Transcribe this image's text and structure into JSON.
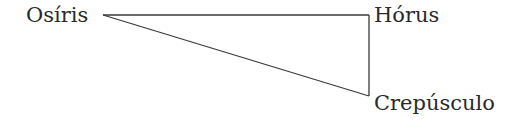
{
  "diagram": {
    "nodes": [
      {
        "id": "osiris",
        "label": "Osíris"
      },
      {
        "id": "horus",
        "label": "Hórus"
      },
      {
        "id": "crepusculo",
        "label": "Crepúsculo"
      }
    ],
    "edges": [
      {
        "from": "osiris",
        "to": "horus"
      },
      {
        "from": "osiris",
        "to": "crepusculo"
      },
      {
        "from": "horus",
        "to": "crepusculo"
      }
    ],
    "line_color": "#3a3a3a",
    "text_color": "#2a2a2a"
  }
}
